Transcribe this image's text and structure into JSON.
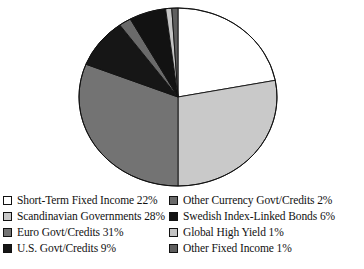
{
  "chart_data": {
    "type": "pie",
    "title": "",
    "subtitle": "",
    "xlabel": "",
    "ylabel": "",
    "legend_position": "bottom",
    "grid": false,
    "start_angle_deg": 0,
    "direction": "clockwise",
    "units": "percent",
    "total": 100,
    "categories": [
      "Short-Term Fixed Income",
      "Scandinavian Governments",
      "Euro Govt/Credits",
      "U.S. Govt/Credits",
      "Other Currency Govt/Credits",
      "Swedish Index-Linked Bonds",
      "Global High Yield",
      "Other Fixed Income"
    ],
    "values": [
      22,
      28,
      31,
      9,
      2,
      6,
      1,
      1
    ],
    "colors": [
      "#ffffff",
      "#c9c9c9",
      "#737373",
      "#161616",
      "#6a6a6a",
      "#121212",
      "#c4c4c4",
      "#5e5e5e"
    ],
    "slices": [
      {
        "label": "Short-Term Fixed Income",
        "value": 22,
        "display": "22%",
        "color": "#ffffff"
      },
      {
        "label": "Scandinavian Governments",
        "value": 28,
        "display": "28%",
        "color": "#c9c9c9"
      },
      {
        "label": "Euro Govt/Credits",
        "value": 31,
        "display": "31%",
        "color": "#737373"
      },
      {
        "label": "U.S. Govt/Credits",
        "value": 9,
        "display": "9%",
        "color": "#161616"
      },
      {
        "label": "Other Currency Govt/Credits",
        "value": 2,
        "display": "2%",
        "color": "#6a6a6a"
      },
      {
        "label": "Swedish Index-Linked Bonds",
        "value": 6,
        "display": "6%",
        "color": "#121212"
      },
      {
        "label": "Global High Yield",
        "value": 1,
        "display": "1%",
        "color": "#c4c4c4"
      },
      {
        "label": "Other Fixed Income",
        "value": 1,
        "display": "1%",
        "color": "#5e5e5e"
      }
    ]
  },
  "legend": {
    "columns": [
      {
        "items": [
          {
            "text": "Short-Term Fixed Income 22%",
            "color": "#ffffff"
          },
          {
            "text": "Scandinavian Governments 28%",
            "color": "#c9c9c9"
          },
          {
            "text": "Euro Govt/Credits 31%",
            "color": "#737373"
          },
          {
            "text": "U.S. Govt/Credits 9%",
            "color": "#161616"
          }
        ]
      },
      {
        "items": [
          {
            "text": "Other Currency Govt/Credits 2%",
            "color": "#6a6a6a"
          },
          {
            "text": "Swedish Index-Linked Bonds 6%",
            "color": "#121212"
          },
          {
            "text": "Global High Yield 1%",
            "color": "#c4c4c4"
          },
          {
            "text": "Other Fixed Income 1%",
            "color": "#5e5e5e"
          }
        ]
      }
    ]
  },
  "style": {
    "background": "#ffffff",
    "outline": "#111111",
    "text": "#111111"
  }
}
